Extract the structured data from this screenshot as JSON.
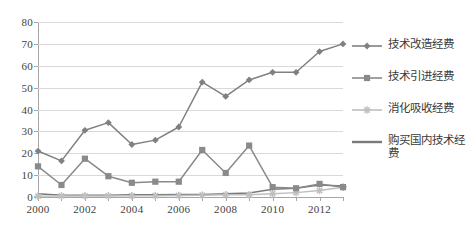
{
  "chart_data": {
    "type": "line",
    "title": "",
    "xlabel": "",
    "ylabel": "",
    "x": [
      2000,
      2001,
      2002,
      2003,
      2004,
      2005,
      2006,
      2007,
      2008,
      2009,
      2010,
      2011,
      2012,
      2013
    ],
    "xtick_labels": [
      "2000",
      "",
      "2002",
      "",
      "2004",
      "",
      "2006",
      "",
      "2008",
      "",
      "2010",
      "",
      "2012",
      ""
    ],
    "xlim": [
      2000,
      2013
    ],
    "ylim": [
      0,
      80
    ],
    "yticks": [
      0,
      10,
      20,
      30,
      40,
      50,
      60,
      70,
      80
    ],
    "ytick_labels": [
      "0",
      "10",
      "20",
      "30",
      "40",
      "50",
      "60",
      "70",
      "80"
    ],
    "grid": "horizontal",
    "legend_position": "right",
    "series": [
      {
        "name": "技术改造经费",
        "marker": "diamond",
        "color": "#808080",
        "values": [
          21.0,
          16.5,
          30.5,
          34.0,
          24.0,
          26.0,
          32.0,
          52.5,
          46.0,
          53.5,
          57.0,
          57.0,
          66.5,
          70.0
        ]
      },
      {
        "name": "技术引进经费",
        "marker": "square",
        "color": "#8a8a8a",
        "values": [
          14.0,
          5.5,
          17.5,
          9.5,
          6.5,
          7.0,
          7.0,
          21.5,
          11.0,
          23.5,
          4.5,
          4.0,
          6.0,
          4.5
        ]
      },
      {
        "name": "消化吸收经费",
        "marker": "asterisk",
        "color": "#bfbfbf",
        "values": [
          0.4,
          0.5,
          0.5,
          0.5,
          0.6,
          0.6,
          0.7,
          0.8,
          1.0,
          1.0,
          1.5,
          2.0,
          3.0,
          4.5
        ]
      },
      {
        "name": "购买国内技术经费",
        "marker": "none",
        "color": "#7a7a7a",
        "values": [
          1.5,
          0.8,
          0.8,
          0.8,
          1.0,
          1.0,
          1.2,
          1.2,
          1.5,
          1.8,
          3.5,
          4.0,
          5.5,
          5.0
        ]
      }
    ]
  }
}
